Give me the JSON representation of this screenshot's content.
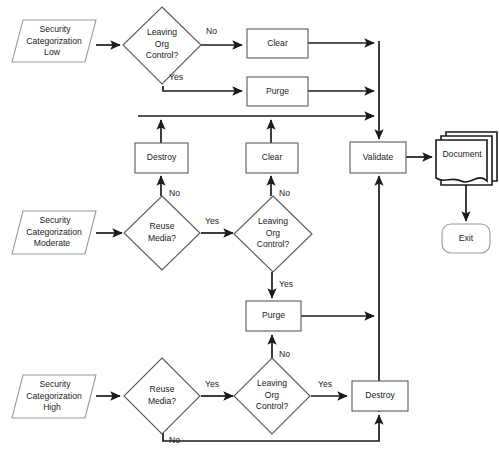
{
  "diagram": {
    "colors": {
      "background": "#ffffff",
      "shape_outline": "#5a5a5a",
      "terminator_outline": "#9a9a9a",
      "document_outline": "#1b1b1b",
      "connector": "#1b1b1b",
      "text": "#1b1b1b"
    },
    "nodes": {
      "start_low": {
        "label_line1": "Security",
        "label_line2": "Categorization",
        "label_line3": "Low",
        "shape": "parallelogram"
      },
      "start_moderate": {
        "label_line1": "Security",
        "label_line2": "Categorization",
        "label_line3": "Moderate",
        "shape": "parallelogram"
      },
      "start_high": {
        "label_line1": "Security",
        "label_line2": "Categorization",
        "label_line3": "High",
        "shape": "parallelogram"
      },
      "decision_low_leaving": {
        "label_line1": "Leaving",
        "label_line2": "Org",
        "label_line3": "Control?",
        "shape": "diamond"
      },
      "decision_mod_reuse": {
        "label_line1": "Reuse",
        "label_line2": "Media?",
        "shape": "diamond"
      },
      "decision_mod_leaving": {
        "label_line1": "Leaving",
        "label_line2": "Org",
        "label_line3": "Control?",
        "shape": "diamond"
      },
      "decision_high_reuse": {
        "label_line1": "Reuse",
        "label_line2": "Media?",
        "shape": "diamond"
      },
      "decision_high_leaving": {
        "label_line1": "Leaving",
        "label_line2": "Org",
        "label_line3": "Control?",
        "shape": "diamond"
      },
      "clear_low": {
        "label": "Clear",
        "shape": "process"
      },
      "purge_low": {
        "label": "Purge",
        "shape": "process"
      },
      "destroy_mod": {
        "label": "Destroy",
        "shape": "process"
      },
      "clear_mod": {
        "label": "Clear",
        "shape": "process"
      },
      "purge_mod": {
        "label": "Purge",
        "shape": "process"
      },
      "destroy_high": {
        "label": "Destroy",
        "shape": "process"
      },
      "validate": {
        "label": "Validate",
        "shape": "process"
      },
      "document": {
        "label": "Document",
        "shape": "multi-document"
      },
      "exit": {
        "label": "Exit",
        "shape": "terminator"
      }
    },
    "edge_labels": {
      "low_no": "No",
      "low_yes": "Yes",
      "mod_reuse_no": "No",
      "mod_reuse_yes": "Yes",
      "mod_leaving_no": "No",
      "mod_leaving_yes": "Yes",
      "high_reuse_no": "No",
      "high_reuse_yes": "Yes",
      "high_leaving_no": "No",
      "high_leaving_yes": "Yes"
    }
  }
}
